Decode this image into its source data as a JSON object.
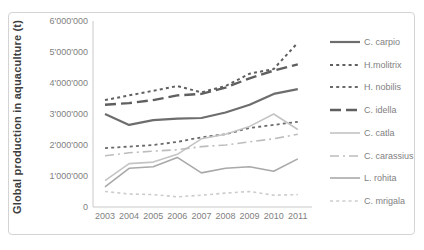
{
  "chart": {
    "y_tick_labels": [
      "0",
      "1'000'000",
      "2'000'000",
      "3'000'000",
      "4'000'000",
      "5'000'000",
      "6'000'000"
    ],
    "axis_color": "#c9c9c9",
    "frame_color": "#d4d4d4",
    "label_color": "#7f7f7f",
    "title_color": "#3d3d3d"
  },
  "chart_data": {
    "type": "line",
    "title": "",
    "xlabel": "",
    "ylabel": "Global production in aquaculture (t)",
    "x": [
      2003,
      2004,
      2005,
      2006,
      2007,
      2008,
      2009,
      2010,
      2011
    ],
    "ylim": [
      0,
      6000000
    ],
    "y_tick_step": 1000000,
    "grid": false,
    "legend_position": "right",
    "series": [
      {
        "name": "C. carpio",
        "style": "solid",
        "color": "#6d6d6d",
        "width": 2.2,
        "values": [
          3000000,
          2650000,
          2800000,
          2850000,
          2870000,
          3050000,
          3300000,
          3650000,
          3800000
        ]
      },
      {
        "name": "H.molitrix",
        "style": "dashed",
        "color": "#606060",
        "width": 2,
        "values": [
          3450000,
          3600000,
          3750000,
          3900000,
          3700000,
          3900000,
          4300000,
          4450000,
          5300000
        ]
      },
      {
        "name": "H. nobilis",
        "style": "dashed",
        "color": "#6a6a6a",
        "width": 1.8,
        "values": [
          1900000,
          1950000,
          2000000,
          2100000,
          2250000,
          2350000,
          2550000,
          2650000,
          2750000
        ]
      },
      {
        "name": "C. idella",
        "style": "long-dash",
        "color": "#5f5f5f",
        "width": 2.4,
        "values": [
          3300000,
          3350000,
          3450000,
          3600000,
          3650000,
          3850000,
          4150000,
          4400000,
          4600000
        ]
      },
      {
        "name": "C. catla",
        "style": "solid",
        "color": "#c4c4c4",
        "width": 1.6,
        "values": [
          850000,
          1400000,
          1450000,
          1700000,
          2200000,
          2350000,
          2600000,
          3000000,
          2500000
        ]
      },
      {
        "name": "C. carassius",
        "style": "dash-dot",
        "color": "#bdbdbd",
        "width": 1.6,
        "values": [
          1650000,
          1750000,
          1800000,
          1850000,
          1950000,
          2000000,
          2100000,
          2200000,
          2350000
        ]
      },
      {
        "name": "L. rohita",
        "style": "solid",
        "color": "#a9a9a9",
        "width": 1.6,
        "values": [
          650000,
          1250000,
          1300000,
          1600000,
          1100000,
          1250000,
          1300000,
          1150000,
          1550000
        ]
      },
      {
        "name": "C. mrigala",
        "style": "dashed",
        "color": "#cccccc",
        "width": 1.6,
        "values": [
          500000,
          420000,
          400000,
          330000,
          380000,
          450000,
          500000,
          380000,
          400000
        ]
      }
    ]
  }
}
